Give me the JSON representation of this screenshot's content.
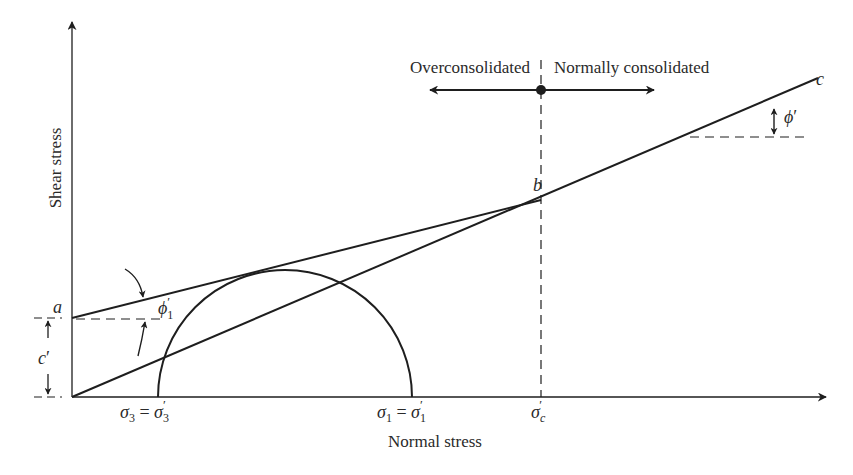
{
  "figure": {
    "type": "Mohr-Coulomb failure envelope for overconsolidated and normally consolidated clay",
    "colors": {
      "line": "#1e1e1e",
      "text": "#2a2a2a",
      "background": "#ffffff"
    }
  },
  "axes": {
    "y_label": "Shear stress",
    "x_label": "Normal stress"
  },
  "x_ticks": {
    "sigma3": {
      "symbol": "σ",
      "sub": "3",
      "eq": " = ",
      "symbol2": "σ",
      "sub2": "3",
      "prime": "′"
    },
    "sigma1": {
      "symbol": "σ",
      "sub": "1",
      "eq": " = ",
      "symbol2": "σ",
      "sub2": "1",
      "prime": "′"
    },
    "sigmac": {
      "symbol": "σ",
      "sub": "c",
      "prime": "′"
    }
  },
  "points": {
    "a": "a",
    "b": "b",
    "c": "c"
  },
  "angles": {
    "phi1": {
      "symbol": "ϕ",
      "sub": "1",
      "prime": "′"
    },
    "phi": {
      "symbol": "ϕ",
      "prime": "′"
    }
  },
  "cohesion": {
    "symbol": "c",
    "prime": "′"
  },
  "regions": {
    "left": "Overconsolidated",
    "right": "Normally consolidated"
  }
}
